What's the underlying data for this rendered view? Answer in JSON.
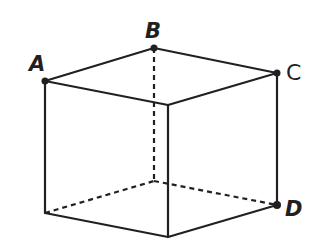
{
  "diagram": {
    "type": "cube",
    "colors": {
      "line": "#231f20",
      "background": "#ffffff"
    },
    "labeled_vertices": [
      {
        "id": "A",
        "label": "A"
      },
      {
        "id": "B",
        "label": "B"
      },
      {
        "id": "C",
        "label": "C"
      },
      {
        "id": "D",
        "label": "D"
      }
    ],
    "edges_visible": 9,
    "edges_hidden": 3
  }
}
